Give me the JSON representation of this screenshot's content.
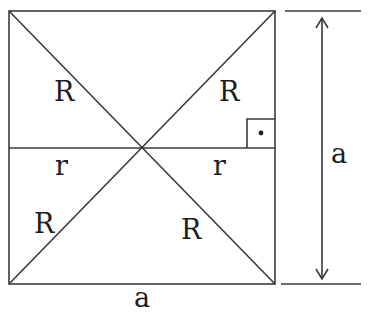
{
  "diagram": {
    "type": "geometry",
    "labels": {
      "R_top_left": "R",
      "R_top_right": "R",
      "R_bottom_left": "R",
      "R_bottom_right": "R",
      "r_left": "r",
      "r_right": "r",
      "side_bottom": "a",
      "side_right_dimension": "a"
    },
    "right_angle_marker": "dot-in-square",
    "colors": {
      "stroke": "#3a3a3a",
      "text": "#1e1e1e",
      "background": "#ffffff"
    }
  }
}
